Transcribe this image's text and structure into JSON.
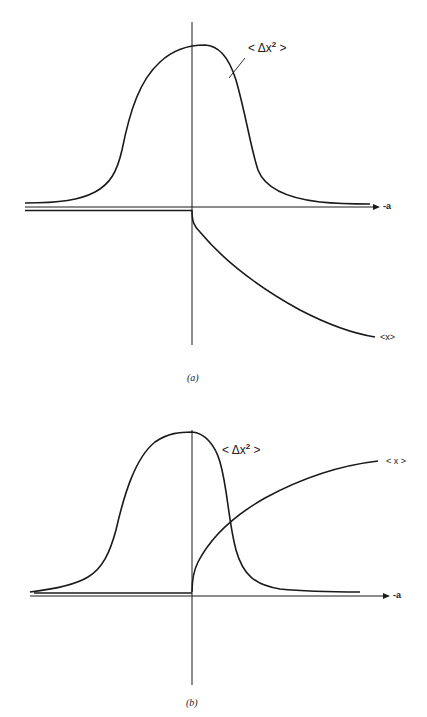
{
  "panels": [
    {
      "id": "a",
      "caption": "(a)",
      "axis_label": "-a",
      "curves": {
        "variance": {
          "label_prefix": "< Δx",
          "label_sup": "2",
          "label_suffix": " >"
        },
        "mean": {
          "label": "<x>"
        }
      }
    },
    {
      "id": "b",
      "caption": "(b)",
      "axis_label": "-a",
      "curves": {
        "variance": {
          "label_prefix": "< Δx",
          "label_sup": "2",
          "label_suffix": " >"
        },
        "mean": {
          "label": "< x >"
        }
      }
    }
  ],
  "colors": {
    "ink": "#1a1a1a",
    "background": "#ffffff"
  }
}
